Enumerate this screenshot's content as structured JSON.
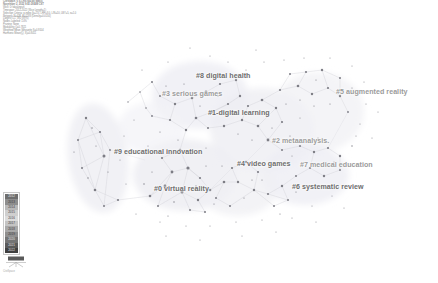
{
  "header": {
    "lines": [
      "CiteSpace, v. 6.1.R6 (64-bit) Basic",
      "November 2, 2022 9:41:28 AM CST",
      "WoS: D:\\data\\input\\",
      "Timespan: 2012-2022 (Slice Length=1)",
      "Selection Criteria: g-index (k=25), LRF=3.0, L/N=10, LBY=5, e=1.0",
      "Network: N=438, E=1283 (Density=0.0134)",
      "Largest CC: 392 (89%)",
      "Nodes Labeled: 1.0%",
      "Pruning: None",
      "Modularity Q=0.7821",
      "Weighted Mean Silhouette S=0.9104",
      "Harmonic Mean(Q, S)=0.8411"
    ]
  },
  "chart": {
    "type": "cluster-network",
    "background": "#ffffff",
    "node_color": "#7a7a7a",
    "edge_color": "#cfcfd6",
    "hull_color": "#f2f2f5"
  },
  "clusters": [
    {
      "id": "#0",
      "label": "#0 virtual reality",
      "x": 154,
      "y": 185,
      "tone": "dark"
    },
    {
      "id": "#1",
      "label": "#1-digital learning",
      "x": 208,
      "y": 109,
      "tone": "dark"
    },
    {
      "id": "#2",
      "label": "#2 metaanalysis.",
      "x": 272,
      "y": 137,
      "tone": "light"
    },
    {
      "id": "#3",
      "label": "#3 serious games",
      "x": 162,
      "y": 90,
      "tone": "light"
    },
    {
      "id": "#4",
      "label": "#4 video games",
      "x": 237,
      "y": 160,
      "tone": "dark"
    },
    {
      "id": "#5",
      "label": "#5 augmented reality",
      "x": 336,
      "y": 88,
      "tone": "light"
    },
    {
      "id": "#6",
      "label": "#6 systematic review",
      "x": 292,
      "y": 183,
      "tone": "dark"
    },
    {
      "id": "#7",
      "label": "#7 medical education",
      "x": 300,
      "y": 161,
      "tone": "light"
    },
    {
      "id": "#8",
      "label": "#8 digital health",
      "x": 196,
      "y": 72,
      "tone": "dark"
    },
    {
      "id": "#9",
      "label": "#9 educational innovation",
      "x": 114,
      "y": 148,
      "tone": "dark"
    }
  ],
  "legend": {
    "name": "year-color-legend",
    "title": "Year",
    "entries": [
      {
        "year": "2012",
        "color": "#6e6e6e"
      },
      {
        "year": "2013",
        "color": "#8d8d8d"
      },
      {
        "year": "2014",
        "color": "#b8b8b8"
      },
      {
        "year": "2015",
        "color": "#cfcfcf"
      },
      {
        "year": "2016",
        "color": "#dcdcdc"
      },
      {
        "year": "2017",
        "color": "#c4c4c4"
      },
      {
        "year": "2018",
        "color": "#a8a8a8"
      },
      {
        "year": "2019",
        "color": "#8f8f8f"
      },
      {
        "year": "2020",
        "color": "#747474"
      },
      {
        "year": "2021",
        "color": "#5a5a5a"
      },
      {
        "year": "2022",
        "color": "#3f3f3f"
      }
    ]
  },
  "footer": {
    "caption": "CiteSpace"
  }
}
